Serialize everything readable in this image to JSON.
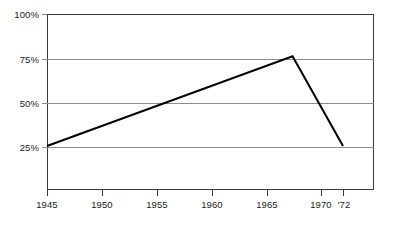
{
  "chart_data": {
    "type": "line",
    "title": "",
    "subtitle": "",
    "xlabel": "",
    "ylabel": "",
    "xlim": [
      1945,
      1974
    ],
    "ylim": [
      0,
      100
    ],
    "grid": true,
    "legend": null,
    "x_tick_values": [
      1945,
      1950,
      1955,
      1960,
      1965,
      1970,
      1972
    ],
    "x_tick_labels": [
      "1945",
      "1950",
      "1955",
      "1960",
      "1965",
      "1970",
      "'72"
    ],
    "y_tick_values": [
      25,
      50,
      75,
      100
    ],
    "y_tick_labels": [
      "25%",
      "50%",
      "75%",
      "100%"
    ],
    "series": [
      {
        "name": "series-1",
        "color": "#000000",
        "x": [
          1945,
          1967.4,
          1972
        ],
        "values": [
          25,
          76,
          25
        ],
        "points": [
          {
            "x": 1945,
            "y": 25
          },
          {
            "x": 1967.4,
            "y": 76
          },
          {
            "x": 1972,
            "y": 25
          }
        ]
      }
    ],
    "annotations": []
  },
  "axes": {
    "y_labels": [
      {
        "text": "100%",
        "value": 100
      },
      {
        "text": "75%",
        "value": 75
      },
      {
        "text": "50%",
        "value": 50
      },
      {
        "text": "25%",
        "value": 25
      }
    ],
    "x_labels": [
      {
        "text": "1945",
        "value": 1945
      },
      {
        "text": "1950",
        "value": 1950
      },
      {
        "text": "1955",
        "value": 1955
      },
      {
        "text": "1960",
        "value": 1960
      },
      {
        "text": "1965",
        "value": 1965
      },
      {
        "text": "1970",
        "value": 1970
      },
      {
        "text": "'72",
        "value": 1972
      }
    ]
  },
  "colors": {
    "frame": "#3a3a3a",
    "gridline": "#8d8d8d",
    "series": "#000000",
    "background": "#ffffff",
    "text": "#1a1a1a"
  }
}
